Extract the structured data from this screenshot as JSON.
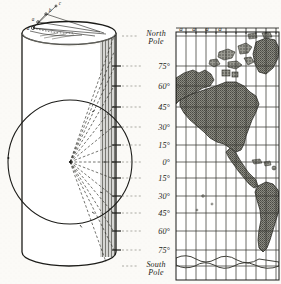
{
  "figure": {
    "background_color": "#fbfaf7",
    "ink_color": "#1b1b18"
  },
  "cylinder": {
    "label": "projection-cylinder",
    "shading_color": "#6d6d66",
    "apex_marks": [
      "a",
      "a",
      "b",
      "c"
    ]
  },
  "globe": {
    "label": "inscribed-globe",
    "center_mark": "center-point",
    "ray_count": 14
  },
  "latitude_scale": {
    "north_pole_label": "North\nPole",
    "north_pole_line1": "North",
    "north_pole_line2": "Pole",
    "south_pole_line1": "South",
    "south_pole_line2": "Pole",
    "labels": [
      {
        "text": "75°",
        "value": 75,
        "y": 66
      },
      {
        "text": "60°",
        "value": 60,
        "y": 86
      },
      {
        "text": "45°",
        "value": 45,
        "y": 107
      },
      {
        "text": "30°",
        "value": 30,
        "y": 127
      },
      {
        "text": "15°",
        "value": 15,
        "y": 145
      },
      {
        "text": "0°",
        "value": 0,
        "y": 162
      },
      {
        "text": "15°",
        "value": -15,
        "y": 178
      },
      {
        "text": "30°",
        "value": -30,
        "y": 196
      },
      {
        "text": "45°",
        "value": -45,
        "y": 213
      },
      {
        "text": "60°",
        "value": -60,
        "y": 231
      },
      {
        "text": "75°",
        "value": -75,
        "y": 250
      }
    ]
  },
  "map": {
    "label": "cylindrical-projection-map",
    "land_color": "#7d7d75",
    "graticule_color": "#3a3a33",
    "meridian_labels": [
      "a",
      "a",
      "a",
      "a"
    ],
    "meridian_count": 10,
    "parallel_count": 12,
    "regions": [
      "North America",
      "Greenland",
      "South America",
      "Alaska",
      "Caribbean"
    ]
  }
}
